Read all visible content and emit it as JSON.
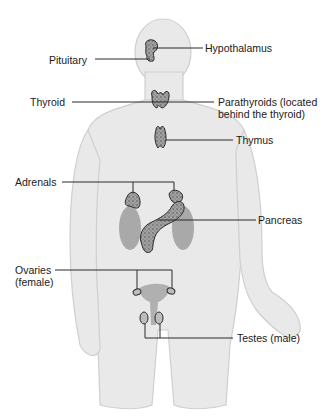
{
  "diagram": {
    "colors": {
      "body": "#e8e8e8",
      "body_outline": "#c8c8c8",
      "gland_fill": "#9a9a9a",
      "gland_outline": "#2a2a2a",
      "kidney": "#a8a8a8",
      "leader_line": "#2a2a2a",
      "text": "#1a1a1a"
    },
    "labels": {
      "hypothalamus": "Hypothalamus",
      "pituitary": "Pituitary",
      "thyroid": "Thyroid",
      "parathyroids_line1": "Parathyroids (located",
      "parathyroids_line2": "behind the thyroid)",
      "thymus": "Thymus",
      "adrenals": "Adrenals",
      "pancreas": "Pancreas",
      "ovaries_line1": "Ovaries",
      "ovaries_line2": "(female)",
      "testes": "Testes (male)"
    }
  }
}
